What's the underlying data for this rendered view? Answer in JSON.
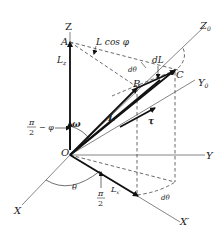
{
  "figure": {
    "axes": {
      "Z": "Z",
      "Y": "Y",
      "X": "X",
      "Z0": "Z",
      "Z0_sub": "0",
      "Y0": "Y",
      "Y0_sub": "0",
      "X_prime": "X′"
    },
    "points": {
      "O": "O",
      "A": "A",
      "B": "B",
      "C": "C"
    },
    "labels": {
      "L_z": "L",
      "L_z_sub": "z",
      "L_cos_phi": "L cos φ",
      "dL": "dL",
      "d_theta_top": "dθ",
      "d_theta_bottom": "dθ",
      "L_vec": "L",
      "tau": "τ",
      "omega": "ω",
      "theta": "θ",
      "pi_over_2_num": "π",
      "pi_over_2_den": "2",
      "pi_half_minus_phi_num": "π",
      "pi_half_minus_phi_den": "2",
      "pi_half_minus_phi_rest": "− φ",
      "L_x_prime": "L",
      "L_x_prime_sub": "x′"
    }
  }
}
